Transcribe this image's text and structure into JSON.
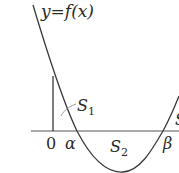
{
  "figure": {
    "function_label": "y=f(x)",
    "region_labels": {
      "s1": {
        "main": "S",
        "sub": "1"
      },
      "s2": {
        "main": "S",
        "sub": "2"
      },
      "s3_partial": {
        "main": "S"
      }
    },
    "axis_labels": {
      "origin": "0",
      "alpha": "α",
      "beta": "β"
    },
    "colors": {
      "line": "#3a3a3a",
      "axis": "#555555",
      "background": "#ffffff"
    }
  }
}
